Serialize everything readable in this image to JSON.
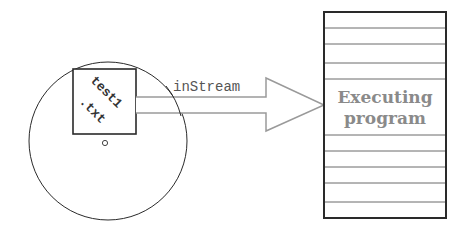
{
  "diagram": {
    "disk": {
      "file_name_line1": "test1",
      "file_name_line2": ".txt",
      "spindle_glyph": "o"
    },
    "stream": {
      "label": "inStream"
    },
    "program": {
      "label_line1": "Executing",
      "label_line2": "program"
    },
    "colors": {
      "stroke_dark": "#2a2a2a",
      "stroke_grey": "#9a9a9a",
      "program_text": "#8a8a8a",
      "file_text": "#333333",
      "stream_text": "#555555"
    }
  }
}
